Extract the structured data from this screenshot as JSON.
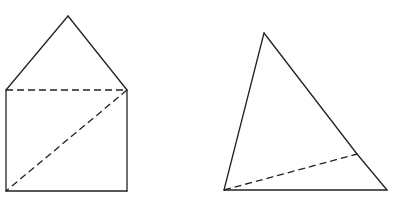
{
  "diagram": {
    "stroke_color": "#222222",
    "background": "#ffffff",
    "figures": [
      {
        "name": "house-net",
        "description": "square with triangle on top; dashed top edge and dashed diagonal",
        "vertices": {
          "apex": [
            68,
            16
          ],
          "top_left": [
            6,
            90
          ],
          "top_right": [
            127,
            90
          ],
          "bottom_left": [
            6,
            191
          ],
          "bottom_right": [
            127,
            191
          ]
        },
        "solid_edges": [
          [
            "top_left",
            "apex"
          ],
          [
            "apex",
            "top_right"
          ],
          [
            "top_left",
            "bottom_left"
          ],
          [
            "bottom_left",
            "bottom_right"
          ],
          [
            "bottom_right",
            "top_right"
          ]
        ],
        "dashed_edges": [
          [
            "top_left",
            "top_right"
          ],
          [
            "top_right",
            "bottom_left"
          ]
        ]
      },
      {
        "name": "folded-tetrahedron",
        "description": "tall triangle plus flat triangle sharing a dashed edge",
        "vertices": {
          "apex": [
            264,
            33
          ],
          "middle": [
            357,
            154
          ],
          "bottom_left": [
            224,
            190
          ],
          "bottom_right": [
            387,
            190
          ]
        },
        "solid_edges": [
          [
            "bottom_left",
            "apex"
          ],
          [
            "apex",
            "middle"
          ],
          [
            "middle",
            "bottom_right"
          ],
          [
            "bottom_right",
            "bottom_left"
          ]
        ],
        "dashed_edges": [
          [
            "bottom_left",
            "middle"
          ]
        ]
      }
    ]
  }
}
